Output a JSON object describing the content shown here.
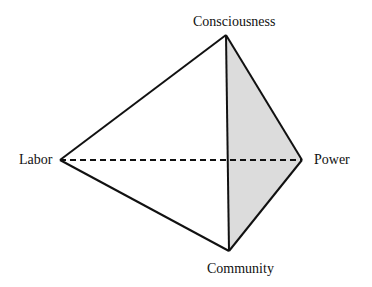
{
  "diagram": {
    "type": "tetrahedron",
    "nodes": [
      {
        "id": "consciousness",
        "label": "Consciousness",
        "x": 226,
        "y": 35
      },
      {
        "id": "labor",
        "label": "Labor",
        "x": 60,
        "y": 160
      },
      {
        "id": "power",
        "label": "Power",
        "x": 302,
        "y": 160
      },
      {
        "id": "community",
        "label": "Community",
        "x": 229,
        "y": 251
      }
    ],
    "edges": [
      {
        "from": "labor",
        "to": "consciousness",
        "style": "solid"
      },
      {
        "from": "labor",
        "to": "community",
        "style": "solid"
      },
      {
        "from": "consciousness",
        "to": "community",
        "style": "solid"
      },
      {
        "from": "consciousness",
        "to": "power",
        "style": "solid"
      },
      {
        "from": "power",
        "to": "community",
        "style": "solid"
      },
      {
        "from": "labor",
        "to": "power",
        "style": "dashed"
      }
    ],
    "shaded_face": [
      "consciousness",
      "power",
      "community"
    ],
    "colors": {
      "stroke": "#111111",
      "shade": "#d9d9d9"
    }
  }
}
